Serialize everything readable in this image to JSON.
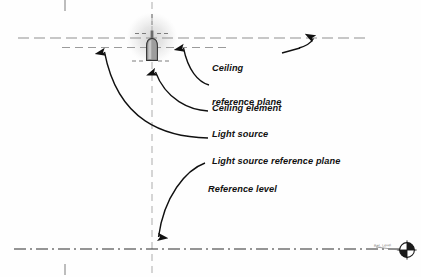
{
  "diagram": {
    "background_color": "#fefefe",
    "line_color_construction": "#9a9a9a",
    "line_color_leader": "#101010",
    "text_color": "#111111",
    "glow_color": "#e3e3e3"
  },
  "labels": [
    {
      "id": "ceiling-reference-plane",
      "line1": "Ceiling",
      "line2": "reference plane",
      "x": 212,
      "y": 42
    },
    {
      "id": "ceiling-element",
      "line1": "Ceiling element",
      "line2": "",
      "x": 212,
      "y": 81
    },
    {
      "id": "light-source",
      "line1": "Light source",
      "line2": "",
      "x": 212,
      "y": 107
    },
    {
      "id": "light-source-reference-plane",
      "line1": "Light source reference plane",
      "line2": "",
      "x": 212,
      "y": 134
    },
    {
      "id": "reference-level",
      "line1": "Reference level",
      "line2": "",
      "x": 208,
      "y": 162
    }
  ],
  "reference_planes": [
    {
      "id": "ceiling-reference-plane-line",
      "label": "Ceiling reference plane",
      "y": 38,
      "x1": 18,
      "x2": 366,
      "style": "dashed"
    },
    {
      "id": "light-source-reference-plane-line",
      "label": "Light source reference plane",
      "y": 47,
      "x1": 62,
      "x2": 231,
      "style": "dashed"
    },
    {
      "id": "reference-level-line",
      "label": "Reference level",
      "y": 249,
      "x1": 14,
      "x2": 408,
      "style": "dash-dot"
    }
  ],
  "axes": [
    {
      "id": "vertical-centerline",
      "x": 152,
      "y1": 2,
      "y2": 275,
      "style": "dashed"
    },
    {
      "id": "top-edge-tick",
      "x": 65,
      "y1": 0,
      "y2": 11,
      "style": "solid"
    },
    {
      "id": "bottom-edge-tick",
      "x": 65,
      "y1": 264,
      "y2": 275,
      "style": "solid"
    }
  ],
  "fixture": {
    "id": "recessed-luminaire",
    "center_x": 152,
    "glow_center_y": 38,
    "glow_radius": 26,
    "lamp_top_y": 33,
    "lamp_bottom_y": 61,
    "lamp_width": 11,
    "body_color": "#8e8e8e",
    "outline_color": "#3a3a3a"
  },
  "watermark": {
    "text": "Ref. Level",
    "symbol": "datum-target-symbol",
    "x": 374,
    "y": 246
  }
}
